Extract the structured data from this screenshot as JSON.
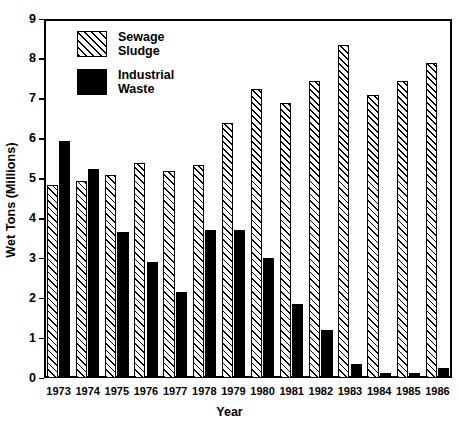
{
  "chart_data": {
    "type": "bar",
    "title": "",
    "xlabel": "Year",
    "ylabel": "Wet Tons (Millions)",
    "categories": [
      "1973",
      "1974",
      "1975",
      "1976",
      "1977",
      "1978",
      "1979",
      "1980",
      "1981",
      "1982",
      "1983",
      "1984",
      "1985",
      "1986"
    ],
    "ylim": [
      0,
      9
    ],
    "yticks": [
      "0",
      "1",
      "2",
      "3",
      "4",
      "5",
      "6",
      "7",
      "8",
      "9"
    ],
    "grid": false,
    "legend_position": "top-left-inside",
    "series": [
      {
        "name": "Sewage\nSludge",
        "fill": "hatched-diagonal",
        "color": "#000000",
        "values": [
          4.85,
          4.95,
          5.1,
          5.4,
          5.2,
          5.35,
          6.4,
          7.25,
          6.9,
          7.45,
          8.35,
          7.1,
          7.45,
          7.9
        ]
      },
      {
        "name": "Industrial\nWaste",
        "fill": "solid-black",
        "color": "#000000",
        "values": [
          5.95,
          5.25,
          3.65,
          2.9,
          2.15,
          3.7,
          3.7,
          3.0,
          1.85,
          1.2,
          0.35,
          0.12,
          0.12,
          0.25
        ]
      }
    ]
  },
  "legend": {
    "entries": [
      {
        "label": "Sewage\nSludge",
        "swatch": "hatched-diagonal"
      },
      {
        "label": "Industrial\nWaste",
        "swatch": "solid-black"
      }
    ]
  },
  "axes": {
    "y_title": "Wet Tons (Millions)",
    "x_title": "Year"
  }
}
